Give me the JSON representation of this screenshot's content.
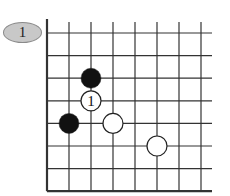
{
  "diagram": {
    "badge_label": "1",
    "board": {
      "columns": 8,
      "rows": 8,
      "origin_x": 47,
      "origin_y": 33,
      "spacing_x": 22,
      "spacing_y": 22.6,
      "edges": {
        "left": "closed",
        "bottom": "closed",
        "top": "open",
        "right": "open"
      }
    },
    "stones": [
      {
        "color": "black",
        "col": 2,
        "row": 2,
        "label": ""
      },
      {
        "color": "white",
        "col": 2,
        "row": 3,
        "label": "1"
      },
      {
        "color": "black",
        "col": 1,
        "row": 4,
        "label": ""
      },
      {
        "color": "white",
        "col": 3,
        "row": 4,
        "label": ""
      },
      {
        "color": "white",
        "col": 5,
        "row": 5,
        "label": ""
      }
    ],
    "colors": {
      "grid": "#333333",
      "black_stone": "#111111",
      "white_stone": "#ffffff",
      "badge_fill": "#c8c8c8"
    }
  }
}
